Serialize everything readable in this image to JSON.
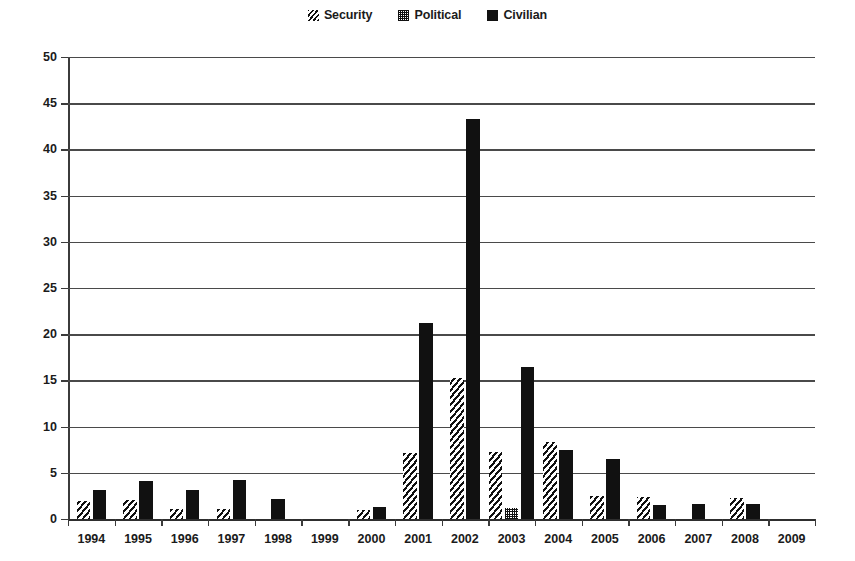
{
  "legend": {
    "position": "top-center",
    "entries": [
      {
        "label": "Security",
        "pattern": "diagonal-hatch",
        "swatch_class": "sw-security"
      },
      {
        "label": "Political",
        "pattern": "dotted-grid",
        "swatch_class": "sw-political"
      },
      {
        "label": "Civilian",
        "pattern": "solid-black",
        "swatch_class": "sw-civilian"
      }
    ]
  },
  "colors": {
    "ink": "#111111",
    "axis": "#3b3b3b",
    "grid": "#4a4a4a",
    "background": "#ffffff"
  },
  "chart_data": {
    "type": "bar",
    "title": "",
    "subtitle": "",
    "xlabel": "",
    "ylabel": "",
    "grid": true,
    "legend_position": "top-center",
    "ylim": [
      0,
      50
    ],
    "ytick_step": 5,
    "yticks": [
      0,
      5,
      10,
      15,
      20,
      25,
      30,
      35,
      40,
      45,
      50
    ],
    "ytick_labels": [
      "0",
      "5",
      "10",
      "15",
      "20",
      "25",
      "30",
      "35",
      "40",
      "45",
      "50"
    ],
    "categories": [
      "1994",
      "1995",
      "1996",
      "1997",
      "1998",
      "1999",
      "2000",
      "2001",
      "2002",
      "2003",
      "2004",
      "2005",
      "2006",
      "2007",
      "2008",
      "2009"
    ],
    "series": [
      {
        "name": "Security",
        "pattern": "diagonal-hatch",
        "bar_class": "bar-security",
        "values": [
          2.0,
          2.1,
          1.1,
          1.1,
          0,
          0,
          1.0,
          7.1,
          15.3,
          7.2,
          8.3,
          2.5,
          2.4,
          0,
          2.3,
          0
        ]
      },
      {
        "name": "Political",
        "pattern": "dotted-grid",
        "bar_class": "bar-political",
        "values": [
          0,
          0,
          0,
          0,
          0,
          0,
          0,
          0,
          0,
          1.2,
          0,
          0,
          0,
          0,
          0,
          0
        ]
      },
      {
        "name": "Civilian",
        "pattern": "solid-black",
        "bar_class": "bar-civilian",
        "values": [
          3.1,
          4.1,
          3.1,
          4.2,
          2.2,
          0,
          1.3,
          21.2,
          43.3,
          16.4,
          7.5,
          6.5,
          1.5,
          1.6,
          1.6,
          0
        ]
      }
    ]
  }
}
